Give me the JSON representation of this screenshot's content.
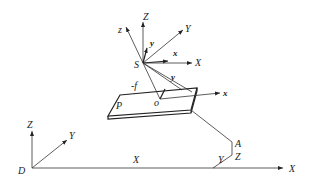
{
  "diagram": {
    "type": "coordinate-systems-geometry",
    "sensor_frame": {
      "origin_label": "S",
      "axes": {
        "Z": "Z",
        "z": "z",
        "Y": "Y",
        "y_upper": "y",
        "x_upper": "x",
        "X": "X",
        "y_lower": "y"
      },
      "focal_label": "-f"
    },
    "image_plane": {
      "plane_label": "P",
      "origin_label": "o",
      "x_axis_label": "x"
    },
    "ground_frame": {
      "origin_label": "D",
      "axes": {
        "Z": "Z",
        "Y": "Y",
        "X": "X"
      },
      "x_offset_label": "X",
      "y_offset_label": "Y",
      "point_label": "A",
      "z_offset_label": "Z"
    },
    "colors": {
      "line": "#333333",
      "text": "#222222",
      "background": "#ffffff"
    }
  }
}
